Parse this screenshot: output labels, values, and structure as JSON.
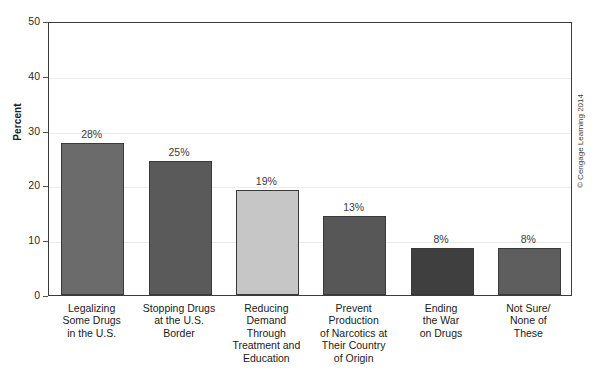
{
  "chart_data": {
    "type": "bar",
    "title": "",
    "xlabel": "",
    "ylabel": "Percent",
    "ylim": [
      0,
      50
    ],
    "yticks": [
      0,
      10,
      20,
      30,
      40,
      50
    ],
    "grid": true,
    "legend": null,
    "categories": [
      "Legalizing\nSome Drugs\nin the U.S.",
      "Stopping Drugs\nat the U.S.\nBorder",
      "Reducing\nDemand\nThrough\nTreatment and\nEducation",
      "Prevent\nProduction\nof Narcotics at\nTheir Country\nof Origin",
      "Ending\nthe War\non Drugs",
      "Not Sure/\nNone of\nThese"
    ],
    "values": [
      28,
      25,
      19,
      13,
      8,
      8
    ],
    "value_labels": [
      "28%",
      "25%",
      "19%",
      "13%",
      "8%",
      "8%"
    ],
    "bar_draw_heights": [
      27.8,
      24.5,
      19.2,
      14.4,
      8.5,
      8.5
    ],
    "bar_colors": [
      "#6b6b6b",
      "#5a5a5a",
      "#c6c6c6",
      "#575757",
      "#3f3f3f",
      "#5e5e5e"
    ]
  },
  "axis": {
    "y_tick_labels": [
      "0",
      "10",
      "20",
      "30",
      "40",
      "50"
    ],
    "y_title": "Percent"
  },
  "credit": {
    "text": "© Cengage Learning 2014"
  }
}
